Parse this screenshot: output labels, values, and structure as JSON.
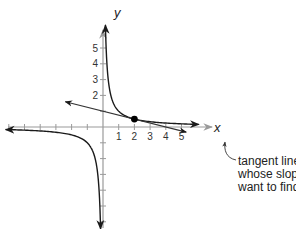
{
  "chart_data": {
    "type": "line",
    "title": "",
    "xlabel": "x",
    "ylabel": "y",
    "xlim": [
      -6.5,
      6.5
    ],
    "ylim": [
      -6.5,
      6.5
    ],
    "x_ticks": [
      1,
      2,
      3,
      4,
      5
    ],
    "y_ticks": [
      2,
      3,
      4,
      5
    ],
    "x_tick_marks": [
      -6,
      -5,
      -4,
      -3,
      -2,
      -1,
      1,
      2,
      3,
      4,
      5
    ],
    "y_tick_marks": [
      -6,
      -5,
      -4,
      -3,
      -2,
      -1,
      1,
      2,
      3,
      4,
      5
    ],
    "grid": false,
    "series": [
      {
        "name": "curve",
        "function": "y = 1/x",
        "style": "solid",
        "color": "#222222"
      },
      {
        "name": "tangent line",
        "function": "y = -x/4 + 1",
        "x_range": [
          -2.4,
          5.3
        ],
        "style": "solid",
        "color": "#333333"
      }
    ],
    "points": [
      {
        "name": "point of tangency",
        "x": 2,
        "y": 0.5
      }
    ],
    "annotations": [
      {
        "text": "tangent line whose slope we want to find",
        "target": "tangent line"
      }
    ]
  },
  "labels": {
    "x_axis": "x",
    "y_axis": "y",
    "callout_lines": [
      "tangent line",
      "whose slope we",
      "want to find"
    ]
  },
  "colors": {
    "axis": "#9a9a9a",
    "curve": "#1a1a1a",
    "tangent": "#333333",
    "point": "#000000"
  }
}
